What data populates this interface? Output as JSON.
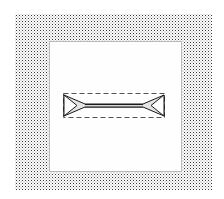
{
  "canvas": {
    "width": 224,
    "height": 199,
    "background_color": "#ffffff",
    "label": "Drawing canvas"
  },
  "dither_region": {
    "name": "halftone-background",
    "label": "Dithered halftone backdrop",
    "x": 15,
    "y": 14,
    "width": 197,
    "height": 176,
    "dot_color": "#3a3a3a",
    "dot_secondary_color": "#8e8e8e",
    "fill_color": "#ffffff",
    "pattern": "checkerboard-dither"
  },
  "drawing_panel": {
    "name": "white-panel",
    "label": "Inner white panel",
    "x": 49,
    "y": 41,
    "width": 133,
    "height": 131,
    "fill_color": "#fefefe",
    "border_color": "#b9b9b9",
    "border_width": 1
  },
  "selection_marquee": {
    "name": "selection-bounding-box",
    "label": "Dashed selection bounding box",
    "x": 63,
    "y": 93,
    "width": 102,
    "height": 25,
    "stroke_color": "#555555",
    "stroke_width": 1,
    "dash_pattern": "5 3",
    "style": "dashed"
  },
  "arrow_shape": {
    "name": "double-headed-arrow",
    "label": "Double headed arrow",
    "x": 63,
    "y": 93,
    "width": 102,
    "height": 25,
    "outline_color": "#1a1a1a",
    "fill_color": "#e4e4e4",
    "shaft_fill_color": "#d9d9d9",
    "stroke_width": 1,
    "direction": "bidirectional",
    "heads": [
      "left",
      "right"
    ],
    "outline_points": "1,2 22,11 80,11 101,2 101,23 80,14 22,14 1,23",
    "shaft_points": "22,11 80,11 80,14 22,14",
    "notch_left_points": "1,2 14,12.5 1,23",
    "notch_right_points": "101,2 88,12.5 101,23"
  }
}
